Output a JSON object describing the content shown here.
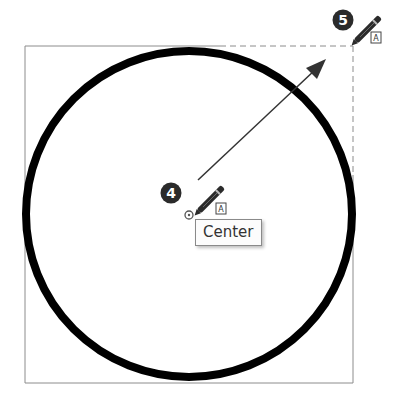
{
  "drawing": {
    "tool": "circle",
    "circle": {
      "cx": 189,
      "cy": 214,
      "r": 163,
      "stroke_width": 8,
      "color": "#000000"
    },
    "bounding_box": {
      "x": 25,
      "y": 46,
      "width": 328,
      "height": 337,
      "color": "#8c8c8c"
    },
    "radius_arrow": {
      "from": [
        198,
        180
      ],
      "to": [
        326,
        60
      ],
      "color": "#333333"
    }
  },
  "steps": [
    {
      "number": "4",
      "label": "Center",
      "badge_color": "#2b2b2b"
    },
    {
      "number": "5",
      "label": "",
      "badge_color": "#2b2b2b"
    }
  ],
  "tooltip": {
    "text": "Center"
  },
  "icons": {
    "pencil": "pencil-icon",
    "snap_text": "text-snap-icon",
    "center_marker": "center-snap-marker-icon"
  },
  "snap_glyph": "A"
}
